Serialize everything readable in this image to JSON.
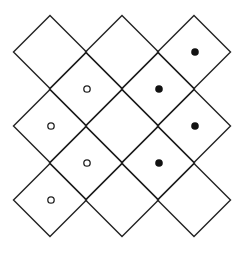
{
  "diagram": {
    "rows": [
      {
        "cells": [
          {
            "marker": "none"
          },
          {
            "marker": "none"
          },
          {
            "marker": "filled"
          }
        ]
      },
      {
        "cells": [
          {
            "marker": "open"
          },
          {
            "marker": "filled"
          }
        ]
      },
      {
        "cells": [
          {
            "marker": "open"
          },
          {
            "marker": "none"
          },
          {
            "marker": "filled"
          }
        ]
      },
      {
        "cells": [
          {
            "marker": "open"
          },
          {
            "marker": "filled"
          }
        ]
      },
      {
        "cells": [
          {
            "marker": "open"
          },
          {
            "marker": "none"
          },
          {
            "marker": "none"
          }
        ]
      }
    ],
    "legend": {
      "filled": "filled-dot",
      "open": "open-circle"
    },
    "colors": {
      "line": "#222222",
      "filled_dot": "#111111",
      "background": "#ffffff"
    }
  }
}
